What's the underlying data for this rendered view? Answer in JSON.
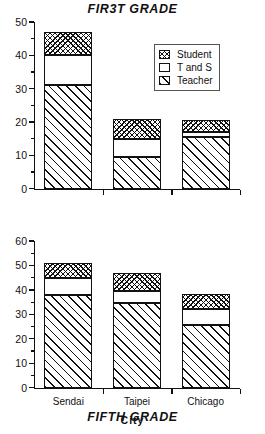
{
  "figure": {
    "background": "#ffffff",
    "ink_color": "#111111"
  },
  "legend": {
    "position": "upper-right-of-top-panel",
    "entries": [
      {
        "label": "Student",
        "pattern": "cross-hatch"
      },
      {
        "label": "T and S",
        "pattern": "empty"
      },
      {
        "label": "Teacher",
        "pattern": "diagonal-hatch"
      }
    ]
  },
  "chart_data": [
    {
      "type": "bar",
      "stacked": true,
      "title": "FIR3T GRADE",
      "xlabel": "",
      "ylabel": "",
      "categories": [
        "Sendai",
        "Taipei",
        "Chicago"
      ],
      "ylim": [
        0,
        50
      ],
      "yticks": [
        0,
        10,
        20,
        30,
        40,
        50
      ],
      "ytick_labels": [
        "0",
        "10",
        "20",
        "30",
        "40",
        "50"
      ],
      "yminor_step": 5,
      "grid": false,
      "legend_position": "upper right",
      "series": [
        {
          "name": "Teacher",
          "pattern": "diagonal-hatch",
          "values": [
            31,
            9.5,
            15.5
          ]
        },
        {
          "name": "T and S",
          "pattern": "empty",
          "values": [
            9,
            5.5,
            1.5
          ]
        },
        {
          "name": "Student",
          "pattern": "cross-hatch",
          "values": [
            7,
            6,
            3.5
          ]
        }
      ],
      "cumulative_tops": {
        "Teacher": [
          31,
          9.5,
          15.5
        ],
        "T and S": [
          40,
          15,
          17
        ],
        "Student": [
          47,
          21,
          20.5
        ]
      }
    },
    {
      "type": "bar",
      "stacked": true,
      "title": "FIFTH GRADE",
      "xlabel": "City",
      "ylabel": "",
      "categories": [
        "Sendai",
        "Taipei",
        "Chicago"
      ],
      "ylim": [
        0,
        60
      ],
      "yticks": [
        0,
        10,
        20,
        30,
        40,
        50,
        60
      ],
      "ytick_labels": [
        "0",
        "10",
        "20",
        "30",
        "40",
        "50",
        "60"
      ],
      "yminor_step": 5,
      "grid": false,
      "legend_position": "none",
      "series": [
        {
          "name": "Teacher",
          "pattern": "diagonal-hatch",
          "values": [
            38,
            34.5,
            25.5
          ]
        },
        {
          "name": "T and S",
          "pattern": "empty",
          "values": [
            7,
            5,
            6.5
          ]
        },
        {
          "name": "Student",
          "pattern": "cross-hatch",
          "values": [
            6,
            7.5,
            6.5
          ]
        }
      ],
      "cumulative_tops": {
        "Teacher": [
          38,
          34.5,
          25.5
        ],
        "T and S": [
          45,
          39.5,
          32
        ],
        "Student": [
          51,
          47,
          38.5
        ]
      }
    }
  ]
}
